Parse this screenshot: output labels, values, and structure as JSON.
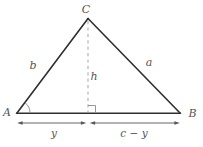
{
  "diagram": {
    "vertices": {
      "A": "A",
      "B": "B",
      "C": "C"
    },
    "sides": {
      "left": "b",
      "right": "a"
    },
    "altitude_label": "h",
    "base_segments": {
      "left": "y",
      "right": "c − y"
    },
    "colors": {
      "line": "#2f2f2f",
      "label": "#565656",
      "dashed": "#adadad",
      "dimension": "#555555",
      "mark": "#8a8a8a",
      "background": "#ffffff"
    }
  }
}
